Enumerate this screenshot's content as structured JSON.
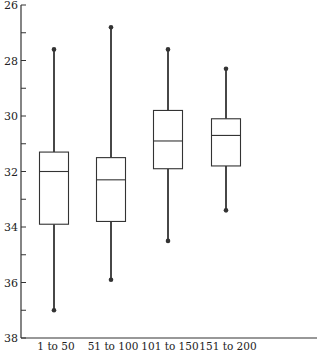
{
  "chart_data": {
    "type": "boxplot",
    "title": "",
    "xlabel": "",
    "ylabel": "",
    "y_inverted": true,
    "ylim": [
      26,
      38
    ],
    "y_major_ticks": [
      26,
      28,
      30,
      32,
      34,
      36,
      38
    ],
    "y_minor_ticks": [
      27,
      29,
      31,
      33,
      35,
      37
    ],
    "grid": false,
    "legend": null,
    "categories": [
      "1 to 50",
      "51 to 100",
      "101 to 150",
      "151 to 200"
    ],
    "series": [
      {
        "name": "1 to 50",
        "whisker_low": 27.6,
        "q1": 31.3,
        "median": 32.0,
        "q3": 33.9,
        "whisker_high": 37.0
      },
      {
        "name": "51 to 100",
        "whisker_low": 26.8,
        "q1": 31.5,
        "median": 32.3,
        "q3": 33.8,
        "whisker_high": 35.9
      },
      {
        "name": "101 to 150",
        "whisker_low": 27.6,
        "q1": 29.8,
        "median": 30.9,
        "q3": 31.9,
        "whisker_high": 34.5
      },
      {
        "name": "151 to 200",
        "whisker_low": 28.3,
        "q1": 30.1,
        "median": 30.7,
        "q3": 31.8,
        "whisker_high": 33.4
      }
    ],
    "colors": {
      "line": "#333333",
      "background": "#ffffff"
    }
  }
}
